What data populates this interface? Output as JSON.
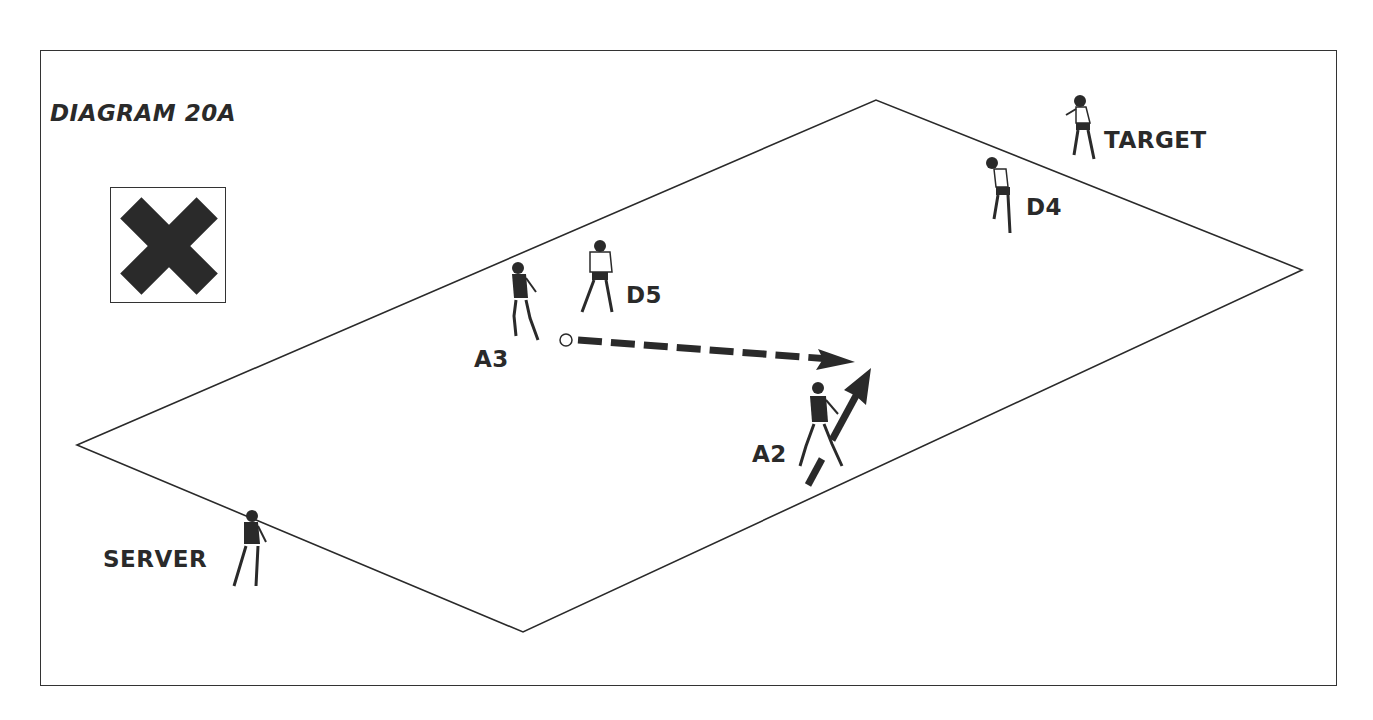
{
  "diagram": {
    "title": "DIAGRAM 20A",
    "legend_icon": "x-cross-icon",
    "labels": {
      "target": "TARGET",
      "d4": "D4",
      "d5": "D5",
      "a3": "A3",
      "a2": "A2",
      "server": "SERVER"
    },
    "field": {
      "corners": [
        [
          77,
          445
        ],
        [
          876,
          100
        ],
        [
          1302,
          270
        ],
        [
          523,
          632
        ]
      ]
    },
    "players": [
      {
        "id": "target",
        "team": "defender",
        "x": 1080,
        "y": 130
      },
      {
        "id": "d4",
        "team": "defender",
        "x": 1003,
        "y": 195
      },
      {
        "id": "d5",
        "team": "defender",
        "x": 601,
        "y": 275
      },
      {
        "id": "a3",
        "team": "attacker",
        "x": 524,
        "y": 300
      },
      {
        "id": "a2",
        "team": "attacker",
        "x": 820,
        "y": 425
      },
      {
        "id": "server",
        "team": "attacker",
        "x": 247,
        "y": 550
      }
    ],
    "arrows": [
      {
        "type": "pass",
        "style": "dashed",
        "from": [
          578,
          340
        ],
        "to": [
          855,
          362
        ]
      },
      {
        "type": "run",
        "style": "solid",
        "from": [
          808,
          485
        ],
        "to": [
          870,
          370
        ]
      }
    ],
    "ball": {
      "x": 566,
      "y": 340
    },
    "colors": {
      "ink": "#2a2a2a",
      "background": "#ffffff"
    }
  }
}
